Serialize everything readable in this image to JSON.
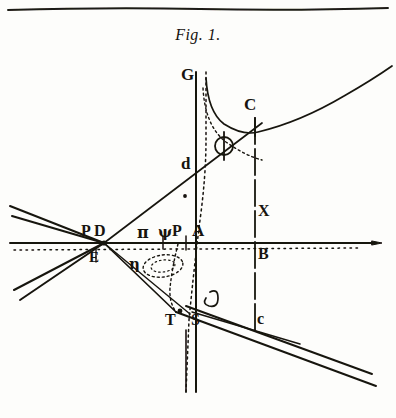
{
  "figure": {
    "title": "Fig. 1.",
    "kind": "geometric-optics-construction",
    "medium": "engraved copper-plate illustration, black ink on aged paper",
    "page_rule": "single horizontal rule across the top of the plate"
  },
  "palette": {
    "ink": "#17140f",
    "ink_soft": "#3a342b",
    "paper": "#fdfdfb",
    "rule": "#1d1a14"
  },
  "labels": [
    {
      "id": "G",
      "text": "G",
      "x": 186,
      "y": 74,
      "size": 17,
      "style": "roman-capital",
      "note": "top of the vertical axis"
    },
    {
      "id": "C_up",
      "text": "C",
      "x": 249,
      "y": 104,
      "size": 17,
      "style": "roman-capital",
      "note": "upper right, on the ordinate through X B"
    },
    {
      "id": "Phi",
      "text": "Φ",
      "x": 219,
      "y": 139,
      "size": 19,
      "style": "greek-capital",
      "note": "capital phi between the dotted asymptote and C"
    },
    {
      "id": "d",
      "text": "d",
      "x": 185,
      "y": 164,
      "size": 16,
      "style": "roman-lower",
      "note": "on the oblique line, above the axis"
    },
    {
      "id": "X",
      "text": "X",
      "x": 262,
      "y": 211,
      "size": 16,
      "style": "roman-capital",
      "note": "above the horizontal axis on the right ordinate"
    },
    {
      "id": "P_left",
      "text": "P",
      "x": 85,
      "y": 231,
      "size": 16,
      "style": "roman-capital",
      "note": "left node, above the axis"
    },
    {
      "id": "D",
      "text": "D",
      "x": 98,
      "y": 231,
      "size": 16,
      "style": "roman-capital",
      "note": "left node, beside P"
    },
    {
      "id": "pi",
      "text": "π",
      "x": 141,
      "y": 233,
      "size": 15,
      "style": "greek-lower",
      "note": "small pi on the axis left of centre"
    },
    {
      "id": "psi",
      "text": "ψ",
      "x": 162,
      "y": 233,
      "size": 14,
      "style": "greek-lower",
      "note": "greek letter immediately left of P"
    },
    {
      "id": "P_cen",
      "text": "P",
      "x": 176,
      "y": 231,
      "size": 16,
      "style": "roman-capital",
      "note": "centre, just left of A"
    },
    {
      "id": "A",
      "text": "A",
      "x": 196,
      "y": 231,
      "size": 17,
      "style": "roman-capital",
      "note": "origin, on the vertical axis"
    },
    {
      "id": "B",
      "text": "B",
      "x": 262,
      "y": 254,
      "size": 16,
      "style": "roman-capital",
      "note": "below the axis on the right ordinate"
    },
    {
      "id": "E",
      "text": "E",
      "x": 93,
      "y": 258,
      "size": 15,
      "style": "roman-capital",
      "note": "below the left node P D"
    },
    {
      "id": "eta",
      "text": "η",
      "x": 133,
      "y": 265,
      "size": 14,
      "style": "greek-lower",
      "note": "left of the small dotted ellipse"
    },
    {
      "id": "delta",
      "text": "δ",
      "x": 205,
      "y": 301,
      "size": 16,
      "style": "greek-lower",
      "note": "above S, on the vertical axis"
    },
    {
      "id": "T",
      "text": "T",
      "x": 169,
      "y": 321,
      "size": 16,
      "style": "roman-capital",
      "note": "lower left of the vertical axis"
    },
    {
      "id": "S",
      "text": "S",
      "x": 195,
      "y": 321,
      "size": 16,
      "style": "roman-capital",
      "note": "foot of the vertical axis"
    },
    {
      "id": "c_low",
      "text": "c",
      "x": 261,
      "y": 320,
      "size": 16,
      "style": "roman-lower",
      "note": "lower right, on the right ordinate"
    }
  ],
  "geometry": {
    "axis_horizontal": {
      "name": "horizontal axis through P D, A, B",
      "y": 243,
      "x_start": 8,
      "x_end": 384
    },
    "axis_vertical": {
      "name": "vertical axis G A S",
      "x": 196,
      "y_start": 72,
      "y_end": 392
    },
    "ordinate_right": {
      "name": "ordinate C X B c",
      "x": 255,
      "y_start": 118,
      "y_end": 330
    },
    "oblique_main": {
      "name": "oblique secant d through the left node",
      "x1": 104,
      "y1": 243,
      "x2": 258,
      "y2": 126
    },
    "asymptote_dotted": {
      "name": "dotted asymptote / curve G-phi-S",
      "style": "dotted"
    },
    "hyperbola_upper": {
      "name": "hyperbola branch rising to the upper right from C"
    },
    "pencil_left": {
      "name": "pencil of four rays meeting at the left node P D E"
    },
    "pencil_lower": {
      "name": "pair of parallel rays descending to the lower right through S c"
    },
    "ellipse_small": {
      "name": "small dotted ellipse below the axis near pi",
      "cx": 163,
      "cy": 266,
      "rx": 20,
      "ry": 11
    },
    "dot_under_d": {
      "name": "ink dot beneath d",
      "x": 185,
      "y": 196
    }
  }
}
